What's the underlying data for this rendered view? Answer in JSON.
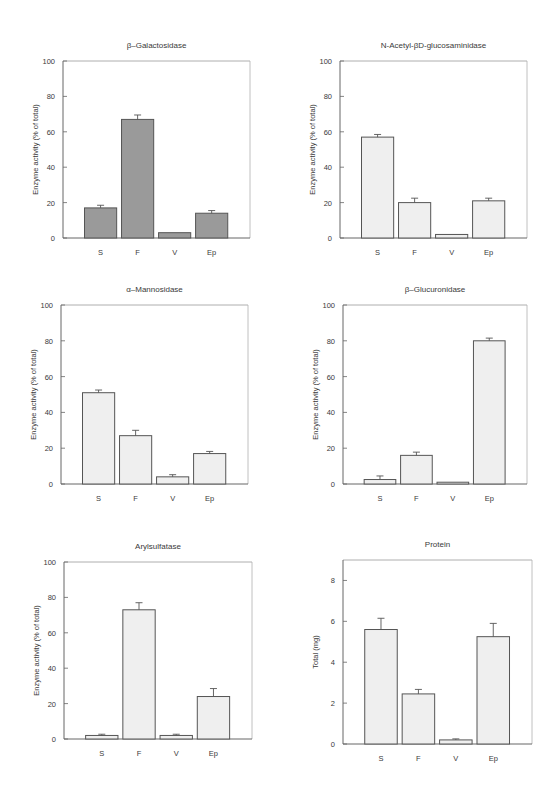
{
  "figure": {
    "categories": [
      "S",
      "F",
      "V",
      "Ep"
    ],
    "colors": {
      "dark_bar": "#9a9a9a",
      "light_bar": "#efefef",
      "bar_edge": "#555555",
      "axis": "#666666"
    }
  },
  "chart_data": [
    {
      "type": "bar",
      "title": "β–Galactosidase",
      "xlabel": "",
      "ylabel": "Enzyme activity (% of total)",
      "categories": [
        "S",
        "F",
        "V",
        "Ep"
      ],
      "values": [
        17,
        67,
        3,
        14
      ],
      "errors": [
        1.5,
        2.5,
        0,
        1.5
      ],
      "ylim": [
        0,
        100
      ],
      "yticks": [
        0,
        20,
        40,
        60,
        80,
        100
      ],
      "fill": "dark",
      "grid": false
    },
    {
      "type": "bar",
      "title": "N-Acetyl-βD-glucosaminidase",
      "xlabel": "",
      "ylabel": "Enzyme activity (% of total)",
      "categories": [
        "S",
        "F",
        "V",
        "Ep"
      ],
      "values": [
        57,
        20,
        2,
        21
      ],
      "errors": [
        1.5,
        2.5,
        0,
        1.5
      ],
      "ylim": [
        0,
        100
      ],
      "yticks": [
        0,
        20,
        40,
        60,
        80,
        100
      ],
      "fill": "light",
      "grid": false
    },
    {
      "type": "bar",
      "title": "α–Mannosidase",
      "xlabel": "",
      "ylabel": "Enzyme activity (% of total)",
      "categories": [
        "S",
        "F",
        "V",
        "Ep"
      ],
      "values": [
        51,
        27,
        4,
        17
      ],
      "errors": [
        1.5,
        3,
        1.2,
        1.2
      ],
      "ylim": [
        0,
        100
      ],
      "yticks": [
        0,
        20,
        40,
        60,
        80,
        100
      ],
      "fill": "light",
      "grid": false
    },
    {
      "type": "bar",
      "title": "β–Glucuronidase",
      "xlabel": "",
      "ylabel": "Enzyme activity (% of total)",
      "categories": [
        "S",
        "F",
        "V",
        "Ep"
      ],
      "values": [
        2.5,
        16,
        1,
        80
      ],
      "errors": [
        2,
        1.8,
        0,
        1.5
      ],
      "ylim": [
        0,
        100
      ],
      "yticks": [
        0,
        20,
        40,
        60,
        80,
        100
      ],
      "fill": "light",
      "grid": false
    },
    {
      "type": "bar",
      "title": "Arylsulfatase",
      "xlabel": "",
      "ylabel": "Enzyme activity (% of total)",
      "categories": [
        "S",
        "F",
        "V",
        "Ep"
      ],
      "values": [
        2,
        73,
        2,
        24
      ],
      "errors": [
        0.7,
        4,
        0.7,
        4.5
      ],
      "ylim": [
        0,
        100
      ],
      "yticks": [
        0,
        20,
        40,
        60,
        80,
        100
      ],
      "fill": "light",
      "grid": false
    },
    {
      "type": "bar",
      "title": "Protein",
      "xlabel": "",
      "ylabel": "Total (mg)",
      "categories": [
        "S",
        "F",
        "V",
        "Ep"
      ],
      "values": [
        5.6,
        2.45,
        0.2,
        5.25
      ],
      "errors": [
        0.55,
        0.22,
        0.05,
        0.65
      ],
      "ylim": [
        0,
        9
      ],
      "yticks": [
        0,
        2,
        4,
        6,
        8
      ],
      "fill": "light",
      "grid": false
    }
  ]
}
